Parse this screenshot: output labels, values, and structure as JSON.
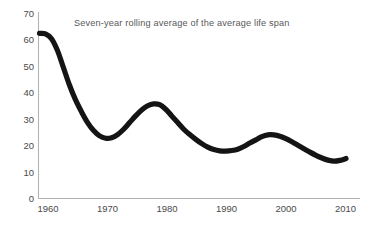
{
  "chart_data": {
    "type": "line",
    "title": "Seven-year rolling average of the average life span",
    "xlabel": "",
    "ylabel": "",
    "xlim": [
      1959,
      2010
    ],
    "ylim": [
      0,
      70
    ],
    "grid": false,
    "legend": null,
    "x_ticks": [
      "1960",
      "1970",
      "1980",
      "1990",
      "2000",
      "2010"
    ],
    "x_tick_values": [
      1960,
      1970,
      1980,
      1990,
      2000,
      2010
    ],
    "y_ticks": [
      "0",
      "10",
      "20",
      "30",
      "40",
      "50",
      "60",
      "70"
    ],
    "y_tick_values": [
      0,
      10,
      20,
      30,
      40,
      50,
      60,
      70
    ],
    "series": [
      {
        "name": "Seven-year rolling average of the average life span",
        "color": "#141414",
        "x": [
          1959,
          1960,
          1961,
          1962,
          1963,
          1964,
          1965,
          1966,
          1967,
          1968,
          1969,
          1970,
          1971,
          1972,
          1973,
          1974,
          1975,
          1976,
          1977,
          1978,
          1979,
          1980,
          1981,
          1982,
          1983,
          1984,
          1985,
          1986,
          1987,
          1988,
          1989,
          1990,
          1991,
          1992,
          1993,
          1994,
          1995,
          1996,
          1997,
          1998,
          1999,
          2000,
          2001,
          2002,
          2003,
          2004,
          2005,
          2006,
          2007,
          2008,
          2009,
          2010
        ],
        "values": [
          62.0,
          61.8,
          60.0,
          55.5,
          49.0,
          42.5,
          37.0,
          32.5,
          28.5,
          25.5,
          23.5,
          22.6,
          22.8,
          24.0,
          26.0,
          28.5,
          31.0,
          33.2,
          34.8,
          35.5,
          35.2,
          33.5,
          31.0,
          28.5,
          26.0,
          24.0,
          22.2,
          20.6,
          19.3,
          18.4,
          17.9,
          17.8,
          18.0,
          18.5,
          19.5,
          20.8,
          22.0,
          23.2,
          23.9,
          23.9,
          23.4,
          22.5,
          21.3,
          20.0,
          18.7,
          17.4,
          16.2,
          15.2,
          14.4,
          14.0,
          14.3,
          15.0
        ]
      }
    ]
  },
  "axis": {
    "y_axis_name": "y-axis-line",
    "x_axis_name": "x-axis-line"
  }
}
